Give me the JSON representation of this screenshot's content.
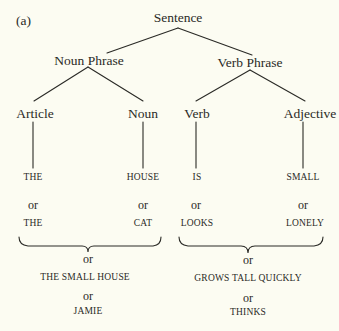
{
  "figure_label": "(a)",
  "tree": {
    "root": "Sentence",
    "phrases": {
      "noun_phrase": "Noun Phrase",
      "verb_phrase": "Verb Phrase"
    },
    "categories": {
      "article": "Article",
      "noun": "Noun",
      "verb": "Verb",
      "adjective": "Adjective"
    },
    "words": {
      "article": "THE",
      "noun": "HOUSE",
      "verb": "IS",
      "adjective": "SMALL"
    },
    "alternatives": {
      "connector": "or",
      "article": "THE",
      "noun": "CAT",
      "verb": "LOOKS",
      "adjective": "LONELY"
    },
    "noun_phrase_alternatives": {
      "connector": "or",
      "items": [
        "THE SMALL HOUSE",
        "JAMIE"
      ]
    },
    "verb_phrase_alternatives": {
      "connector": "or",
      "items": [
        "GROWS TALL QUICKLY",
        "THINKS"
      ]
    }
  },
  "colors": {
    "background": "#fcfcf2",
    "ink": "#2a2a26"
  }
}
